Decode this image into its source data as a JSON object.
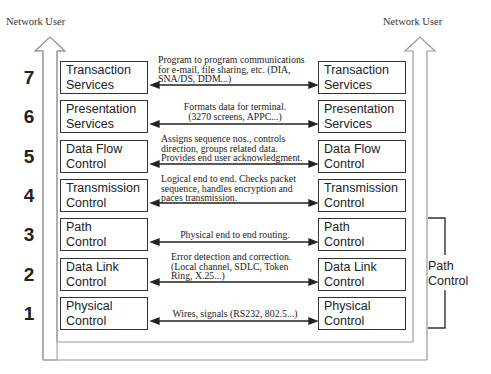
{
  "diagram": {
    "left_user_label": "Network User",
    "right_user_label": "Network User",
    "colors": {
      "line": "#333333",
      "frame": "#999999",
      "text": "#222222",
      "background": "#ffffff"
    },
    "layers": [
      {
        "number": "7",
        "name_line1": "Transaction",
        "name_line2": "Services",
        "desc": [
          "Program to program communications",
          "for e-mail, file sharing, etc. (DIA,",
          "SNA/DS, DDM...)"
        ],
        "desc_align": "left"
      },
      {
        "number": "6",
        "name_line1": "Presentation",
        "name_line2": "Services",
        "desc": [
          "Formats data for terminal.",
          "(3270 screens, APPC...)"
        ],
        "desc_align": "center"
      },
      {
        "number": "5",
        "name_line1": "Data Flow",
        "name_line2": "Control",
        "desc": [
          "Assigns sequence nos., controls",
          "direction, groups related data.",
          "Provides end user acknowledgment."
        ],
        "desc_align": "left"
      },
      {
        "number": "4",
        "name_line1": "Transmission",
        "name_line2": "Control",
        "desc": [
          "Logical end to end.  Checks packet",
          "sequence, handles encryption and",
          "paces transmission."
        ],
        "desc_align": "left"
      },
      {
        "number": "3",
        "name_line1": "Path",
        "name_line2": "Control",
        "desc": [
          "Physical end to end routing."
        ],
        "desc_align": "center"
      },
      {
        "number": "2",
        "name_line1": "Data Link",
        "name_line2": "Control",
        "desc": [
          "Error detection and correction.",
          "(Local channel, SDLC, Token",
          "Ring, X.25...)"
        ],
        "desc_align": "left"
      },
      {
        "number": "1",
        "name_line1": "Physical",
        "name_line2": "Control",
        "desc": [
          "Wires, signals (RS232, 802.5...)"
        ],
        "desc_align": "center"
      }
    ],
    "bracket": {
      "label_line1": "Path",
      "label_line2": "Control",
      "spans_layers": [
        "3",
        "2",
        "1"
      ]
    }
  }
}
